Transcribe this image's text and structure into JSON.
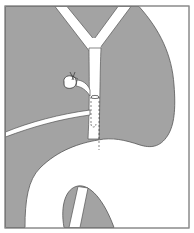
{
  "figure": {
    "type": "anatomical-illustration",
    "labels": [],
    "colors": {
      "tissue": "#a3a3a3",
      "duct": "#ffffff",
      "outline": "#555555",
      "frame": "#8a8a8a",
      "background": "#ffffff"
    },
    "elements": [
      "liver-tissue",
      "right-hepatic-duct",
      "left-hepatic-duct",
      "common-bile-duct",
      "cystic-duct-stump-ligature",
      "intraductal-tube-dashed",
      "pancreatic-duct",
      "duodenum-loop",
      "pancreas-head"
    ]
  }
}
